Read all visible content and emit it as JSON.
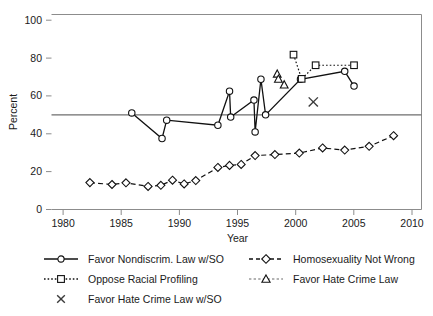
{
  "chart_data": {
    "type": "line",
    "title": "",
    "xlabel": "Year",
    "ylabel": "Percent",
    "xlim": [
      1979,
      2010.8
    ],
    "ylim": [
      0,
      103
    ],
    "xticks": [
      1980,
      1985,
      1990,
      1995,
      2000,
      2005,
      2010
    ],
    "yticks": [
      0,
      20,
      40,
      60,
      80,
      100
    ],
    "grid": false,
    "legend_position": "below",
    "annotations": [
      {
        "type": "hline",
        "y": 50,
        "label": "50 percent reference line"
      }
    ],
    "series": [
      {
        "name": "Favor Nondiscrim. Law w/SO",
        "marker": "circle",
        "linestyle": "solid",
        "points": [
          {
            "x": 1985.9,
            "y": 51.0
          },
          {
            "x": 1988.5,
            "y": 37.5
          },
          {
            "x": 1988.9,
            "y": 47.2
          },
          {
            "x": 1993.3,
            "y": 44.5
          },
          {
            "x": 1994.3,
            "y": 62.5
          },
          {
            "x": 1994.4,
            "y": 48.8
          },
          {
            "x": 1996.4,
            "y": 57.8
          },
          {
            "x": 1996.5,
            "y": 41.0
          },
          {
            "x": 1997.0,
            "y": 68.8
          },
          {
            "x": 1997.4,
            "y": 50.0
          },
          {
            "x": 2000.4,
            "y": 68.8
          },
          {
            "x": 2004.2,
            "y": 73.0
          },
          {
            "x": 2005.0,
            "y": 65.2
          }
        ]
      },
      {
        "name": "Homosexuality Not Wrong",
        "marker": "diamond",
        "linestyle": "dashed",
        "points": [
          {
            "x": 1982.3,
            "y": 14.2
          },
          {
            "x": 1984.2,
            "y": 13.2
          },
          {
            "x": 1985.4,
            "y": 14.1
          },
          {
            "x": 1987.3,
            "y": 12.2
          },
          {
            "x": 1988.4,
            "y": 12.8
          },
          {
            "x": 1989.4,
            "y": 15.5
          },
          {
            "x": 1990.4,
            "y": 13.5
          },
          {
            "x": 1991.4,
            "y": 15.3
          },
          {
            "x": 1993.3,
            "y": 22.2
          },
          {
            "x": 1994.3,
            "y": 23.3
          },
          {
            "x": 1995.3,
            "y": 23.8
          },
          {
            "x": 1996.5,
            "y": 28.5
          },
          {
            "x": 1998.2,
            "y": 29.0
          },
          {
            "x": 2000.3,
            "y": 29.8
          },
          {
            "x": 2002.3,
            "y": 32.5
          },
          {
            "x": 2004.2,
            "y": 31.4
          },
          {
            "x": 2006.3,
            "y": 33.4
          },
          {
            "x": 2008.4,
            "y": 39.0
          }
        ]
      },
      {
        "name": "Oppose Racial Profiling",
        "marker": "square",
        "linestyle": "dotted",
        "points": [
          {
            "x": 1999.8,
            "y": 81.8
          },
          {
            "x": 2000.5,
            "y": 69.0
          },
          {
            "x": 2001.7,
            "y": 76.2
          },
          {
            "x": 2005.0,
            "y": 76.2
          }
        ]
      },
      {
        "name": "Favor Hate Crime Law",
        "marker": "triangle",
        "linestyle": "none",
        "points": [
          {
            "x": 1998.4,
            "y": 71.5
          },
          {
            "x": 1998.5,
            "y": 68.8
          },
          {
            "x": 1999.0,
            "y": 65.8
          }
        ]
      },
      {
        "name": "Favor Hate Crime Law w/SO",
        "marker": "x",
        "linestyle": "none",
        "points": [
          {
            "x": 2001.5,
            "y": 56.8
          }
        ]
      }
    ]
  },
  "axes": {
    "y_label": "Percent",
    "x_label": "Year",
    "y_tick_labels": [
      "0",
      "20",
      "40",
      "60",
      "80",
      "100"
    ],
    "x_tick_labels": [
      "1980",
      "1985",
      "1990",
      "1995",
      "2000",
      "2005",
      "2010"
    ]
  },
  "legend": {
    "items": [
      {
        "label": "Favor Nondiscrim. Law w/SO",
        "marker": "circle",
        "linestyle": "solid"
      },
      {
        "label": "Homosexuality Not Wrong",
        "marker": "diamond",
        "linestyle": "dashed"
      },
      {
        "label": "Oppose Racial Profiling",
        "marker": "square",
        "linestyle": "dotted"
      },
      {
        "label": "Favor Hate Crime Law",
        "marker": "triangle",
        "linestyle": "faint"
      },
      {
        "label": "Favor Hate Crime Law w/SO",
        "marker": "x",
        "linestyle": "none"
      }
    ]
  },
  "colors": {
    "ink": "#111111",
    "frame": "#8c8c8c",
    "refline": "#6e6e6e",
    "background": "#ffffff"
  }
}
